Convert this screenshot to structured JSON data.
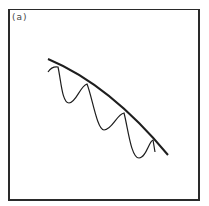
{
  "figure": {
    "panel_label": "(a)",
    "colors": {
      "stroke": "#1e1e1e",
      "background": "#ffffff",
      "frame": "#2a2a2a"
    },
    "curves": {
      "envelope": {
        "description": "smooth decaying envelope line",
        "path": "M 48 59 Q 110 85 168 155"
      },
      "oscillation": {
        "description": "oscillating curve touching the envelope at peaks",
        "path": "M 48 72 Q 52 66 58 67 C 61 80 62 103 69 103 C 76 103 80 86 87 84 C 92 96 97 130 104 130 C 112 130 117 114 124 113 C 128 128 131 158 139 158 C 146 158 149 141 153 140 L 155 152"
      }
    }
  }
}
